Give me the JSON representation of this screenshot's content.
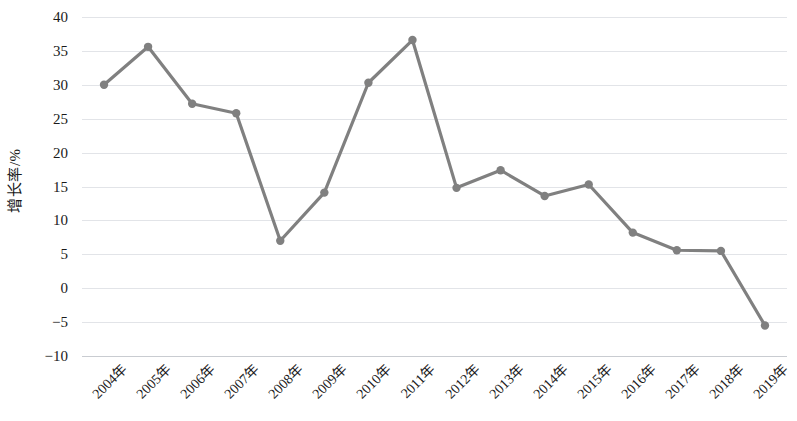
{
  "chart_data": {
    "type": "line",
    "title": "",
    "subtitle": "",
    "xlabel": "",
    "ylabel": "增长率/%",
    "categories": [
      "2004年",
      "2005年",
      "2006年",
      "2007年",
      "2008年",
      "2009年",
      "2010年",
      "2011年",
      "2012年",
      "2013年",
      "2014年",
      "2015年",
      "2016年",
      "2017年",
      "2018年",
      "2019年"
    ],
    "values": [
      30.0,
      35.6,
      27.2,
      25.8,
      7.0,
      14.1,
      30.3,
      36.6,
      14.8,
      17.4,
      13.6,
      15.3,
      8.2,
      5.6,
      5.5,
      -5.5
    ],
    "series": [
      {
        "name": "增长率",
        "values": [
          30.0,
          35.6,
          27.2,
          25.8,
          7.0,
          14.1,
          30.3,
          36.6,
          14.8,
          17.4,
          13.6,
          15.3,
          8.2,
          5.6,
          5.5,
          -5.5
        ]
      }
    ],
    "ylim": [
      -10,
      40
    ],
    "y_ticks": [
      40,
      35,
      30,
      25,
      20,
      15,
      10,
      5,
      0,
      -5,
      -10
    ],
    "y_tick_labels": [
      "40",
      "35",
      "30",
      "25",
      "20",
      "15",
      "10",
      "5",
      "0",
      "−5",
      "−10"
    ],
    "grid": true,
    "grid_axis": "y",
    "legend": false,
    "legend_position": "none",
    "markers": true,
    "marker_shape": "circle",
    "line_color": "#808080",
    "marker_color": "#808080",
    "grid_color": "#e2e4e8",
    "axis_color": "#c9ccd1",
    "text_color": "#1a1a1a",
    "background_color": "#ffffff",
    "line_width": 3.2,
    "marker_radius": 4.2
  }
}
